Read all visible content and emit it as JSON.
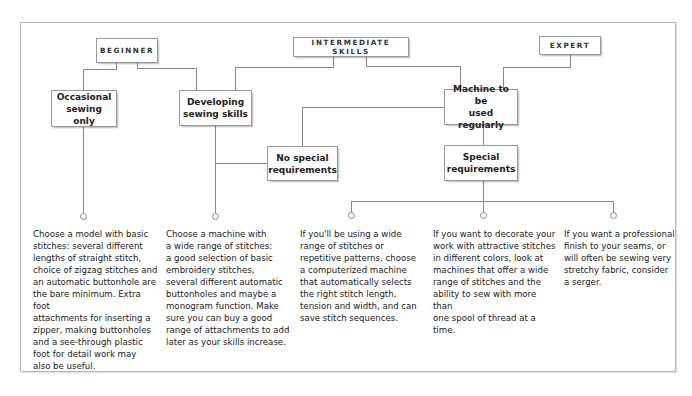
{
  "levels": {
    "beginner": "BEGINNER",
    "intermediate": "INTERMEDIATE SKILLS",
    "expert": "EXPERT"
  },
  "nodes": {
    "occasional": [
      "Occasional",
      "sewing only"
    ],
    "developing": [
      "Developing",
      "sewing skills"
    ],
    "regular": [
      "Machine to be",
      "used regularly"
    ],
    "no_special": [
      "No special",
      "requirements"
    ],
    "special": [
      "Special",
      "requirements"
    ]
  },
  "recommendations": [
    {
      "id": "basic",
      "lines": [
        "Choose a model with basic",
        "stitches: several different",
        "lengths of straight stitch,",
        "choice of zigzag stitches and",
        "an automatic buttonhole are",
        "the bare minimum. Extra foot",
        "attachments for inserting a",
        "zipper, making buttonholes",
        "and a see-through plastic",
        "foot for detail work may",
        "also be useful."
      ]
    },
    {
      "id": "wide-range",
      "lines": [
        "Choose a machine with",
        "a wide range of stitches:",
        "a good selection of basic",
        "embroidery stitches,",
        "several different automatic",
        "buttonholes and maybe a",
        "monogram function. Make",
        "sure you can buy a good",
        "range of attachments to add",
        "later as your skills increase."
      ]
    },
    {
      "id": "computerized",
      "lines": [
        "If you'll be using a wide",
        "range of stitches or",
        "repetitive patterns, choose",
        "a computerized machine",
        "that automatically selects",
        "the right stitch length,",
        "tension and width, and can",
        "save stitch sequences."
      ]
    },
    {
      "id": "decorative",
      "lines": [
        "If you want to decorate your",
        "work with attractive stitches",
        "in different colors, look at",
        "machines that offer a wide",
        "range of stitches and the",
        "ability to sew with more than",
        "one spool of thread at a time."
      ]
    },
    {
      "id": "serger",
      "lines": [
        "If you want a professional",
        "finish to your seams, or",
        "will often be sewing very",
        "stretchy fabric, consider",
        "a serger."
      ]
    }
  ],
  "colors": {
    "line": "#8a8a8a",
    "box_border": "#9a9a9a",
    "text": "#222222"
  }
}
